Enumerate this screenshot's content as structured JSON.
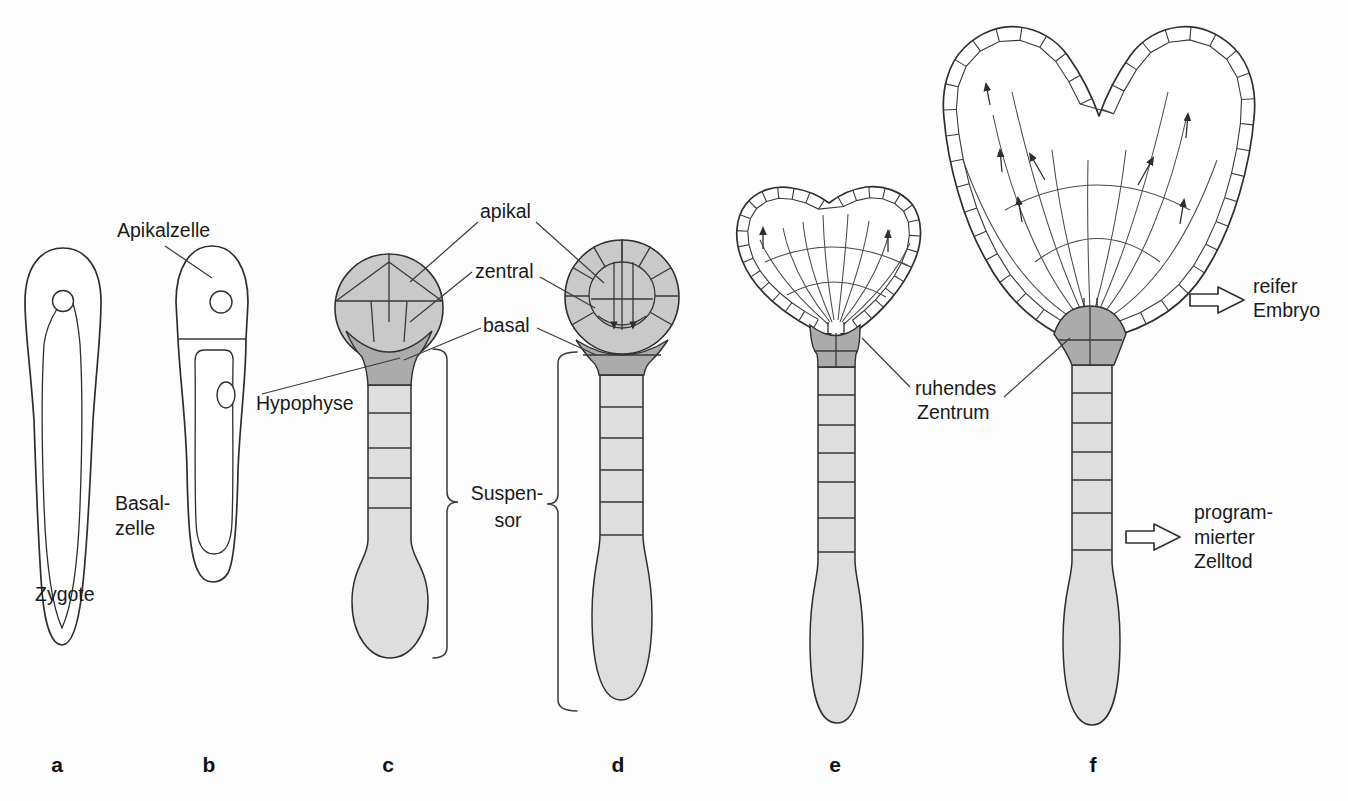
{
  "figure_type": "plant-embryogenesis-diagram",
  "panel_letters": [
    "a",
    "b",
    "c",
    "d",
    "e",
    "f"
  ],
  "labels": {
    "zygote": "Zygote",
    "apikalzelle": "Apikalzelle",
    "basalzelle": [
      "Basal-",
      "zelle"
    ],
    "hypophyse": "Hypophyse",
    "apikal": "apikal",
    "zentral": "zentral",
    "basal": "basal",
    "suspensor": [
      "Suspen-",
      "sor"
    ],
    "ruhendes_zentrum": [
      "ruhendes",
      "Zentrum"
    ],
    "reifer_embryo": [
      "reifer",
      "Embryo"
    ],
    "programmierter_zelltod": [
      "program-",
      "mierter",
      "Zelltod"
    ]
  },
  "colors": {
    "background": "#fdfdfd",
    "outline": "#2e2e2e",
    "embryo_fill": "#c9c9c9",
    "embryo_fill_light": "#d2d2d2",
    "hypophysis_fill": "#ababab",
    "suspensor_fill": "#dedede",
    "text": "#1a1a1a"
  }
}
